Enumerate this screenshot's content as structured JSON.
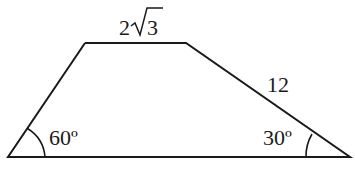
{
  "diagram": {
    "shape": "trapezoid",
    "vertices": {
      "bottom_left": [
        8,
        157
      ],
      "top_left": [
        85,
        43
      ],
      "top_right": [
        186,
        43
      ],
      "bottom_right": [
        350,
        157
      ]
    },
    "line_color": "#1a1a1a",
    "labels": {
      "top_side": {
        "base": "2",
        "radicand": "3",
        "text": "2√3"
      },
      "right_side": "12",
      "left_angle": "60º",
      "right_angle": "30º"
    }
  }
}
